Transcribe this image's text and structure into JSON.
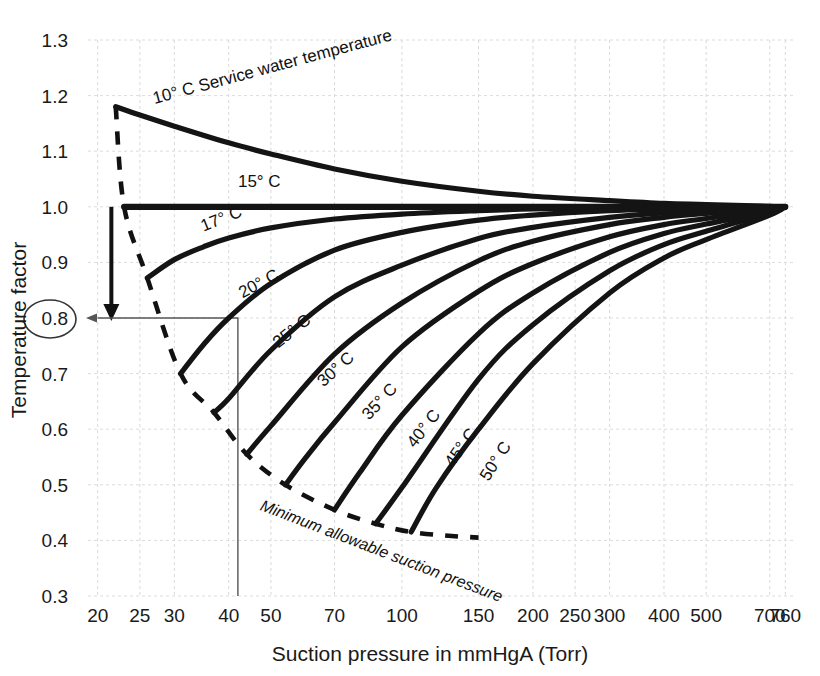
{
  "chart_data": {
    "type": "line",
    "title": "",
    "xlabel": "Suction pressure in mmHgA (Torr)",
    "ylabel": "Temperature factor",
    "xscale": "log",
    "yscale": "linear",
    "xlim": [
      19,
      800
    ],
    "ylim": [
      0.3,
      1.3
    ],
    "grid": true,
    "legend_position": "inline-curve-labels",
    "xticks": [
      20,
      25,
      30,
      40,
      50,
      70,
      100,
      150,
      200,
      250,
      300,
      400,
      500,
      700,
      760
    ],
    "xtick_labels": [
      "20",
      "25",
      "30",
      "40",
      "50",
      "70",
      "100",
      "150",
      "200",
      "250",
      "300",
      "400",
      "500",
      "700",
      "760"
    ],
    "yticks": [
      0.3,
      0.4,
      0.5,
      0.6,
      0.7,
      0.8,
      0.9,
      1.0,
      1.1,
      1.2,
      1.3
    ],
    "ytick_labels": [
      "0.3",
      "0.4",
      "0.5",
      "0.6",
      "0.7",
      "0.8",
      "0.9",
      "1.0",
      "1.1",
      "1.2",
      "1.3"
    ],
    "highlighted_ytick": "0.8",
    "series": [
      {
        "name": "10° C Service water temperature",
        "label": "10° C Service water temperature",
        "x": [
          22,
          25,
          30,
          40,
          50,
          70,
          100,
          150,
          200,
          300,
          400,
          500,
          700,
          760
        ],
        "y": [
          1.18,
          1.165,
          1.145,
          1.115,
          1.095,
          1.068,
          1.046,
          1.028,
          1.019,
          1.011,
          1.006,
          1.004,
          1.001,
          1.0
        ]
      },
      {
        "name": "15° C",
        "label": "15° C",
        "x": [
          23,
          30,
          50,
          100,
          200,
          400,
          760
        ],
        "y": [
          1.0,
          1.0,
          1.0,
          1.0,
          1.0,
          1.0,
          1.0
        ]
      },
      {
        "name": "17° C",
        "label": "17° C",
        "x": [
          26,
          30,
          35,
          40,
          50,
          70,
          100,
          150,
          200,
          300,
          400,
          500,
          700,
          760
        ],
        "y": [
          0.872,
          0.905,
          0.928,
          0.944,
          0.962,
          0.978,
          0.987,
          0.993,
          0.996,
          0.998,
          0.999,
          1.0,
          1.0,
          1.0
        ]
      },
      {
        "name": "20° C",
        "label": "20° C",
        "x": [
          31,
          35,
          40,
          50,
          70,
          100,
          150,
          200,
          300,
          400,
          500,
          700,
          760
        ],
        "y": [
          0.7,
          0.752,
          0.8,
          0.862,
          0.922,
          0.954,
          0.976,
          0.985,
          0.993,
          0.996,
          0.998,
          1.0,
          1.0
        ]
      },
      {
        "name": "25° C",
        "label": "25° C",
        "x": [
          37,
          40,
          50,
          70,
          100,
          150,
          200,
          300,
          400,
          500,
          700,
          760
        ],
        "y": [
          0.63,
          0.655,
          0.742,
          0.838,
          0.895,
          0.943,
          0.963,
          0.981,
          0.989,
          0.993,
          0.998,
          1.0
        ]
      },
      {
        "name": "30° C",
        "label": "30° C",
        "x": [
          44,
          50,
          70,
          100,
          150,
          200,
          300,
          400,
          500,
          700,
          760
        ],
        "y": [
          0.555,
          0.606,
          0.735,
          0.827,
          0.903,
          0.938,
          0.968,
          0.981,
          0.988,
          0.997,
          1.0
        ]
      },
      {
        "name": "35° C",
        "label": "35° C",
        "x": [
          54,
          60,
          70,
          100,
          150,
          200,
          300,
          400,
          500,
          700,
          760
        ],
        "y": [
          0.5,
          0.548,
          0.612,
          0.748,
          0.848,
          0.898,
          0.946,
          0.968,
          0.979,
          0.995,
          1.0
        ]
      },
      {
        "name": "40° C",
        "label": "40° C",
        "x": [
          70,
          80,
          100,
          150,
          200,
          300,
          400,
          500,
          700,
          760
        ],
        "y": [
          0.455,
          0.522,
          0.625,
          0.772,
          0.845,
          0.918,
          0.952,
          0.969,
          0.992,
          1.0
        ]
      },
      {
        "name": "45° C",
        "label": "45° C",
        "x": [
          87,
          100,
          150,
          200,
          300,
          400,
          500,
          700,
          760
        ],
        "y": [
          0.43,
          0.495,
          0.69,
          0.788,
          0.885,
          0.932,
          0.956,
          0.989,
          1.0
        ]
      },
      {
        "name": "50° C",
        "label": "50° C",
        "x": [
          105,
          120,
          150,
          200,
          300,
          400,
          500,
          700,
          760
        ],
        "y": [
          0.415,
          0.495,
          0.6,
          0.718,
          0.845,
          0.908,
          0.941,
          0.985,
          1.0
        ]
      }
    ],
    "annotations": [
      {
        "name": "minimum-allowable-suction-pressure",
        "label": "Minimum allowable suction pressure",
        "style": "dashed",
        "x": [
          22,
          23,
          26,
          31,
          37,
          44,
          54,
          70,
          87,
          105,
          130,
          150
        ],
        "y": [
          1.18,
          1.0,
          0.872,
          0.7,
          0.63,
          0.555,
          0.5,
          0.455,
          0.43,
          0.415,
          0.408,
          0.405
        ]
      },
      {
        "name": "temperature-factor-arrow",
        "label": "",
        "style": "arrow-down",
        "from": {
          "x": 21.5,
          "y": 1.0
        },
        "to": {
          "x": 21.5,
          "y": 0.8
        }
      },
      {
        "name": "construction-line-0-8",
        "label": "",
        "style": "solid-thin",
        "points": [
          {
            "x": 20,
            "y": 0.8
          },
          {
            "x": 42,
            "y": 0.8
          },
          {
            "x": 42,
            "y": 0.3
          }
        ]
      }
    ]
  },
  "axis": {
    "x_title": "Suction pressure in mmHgA (Torr)",
    "y_title": "Temperature factor"
  }
}
